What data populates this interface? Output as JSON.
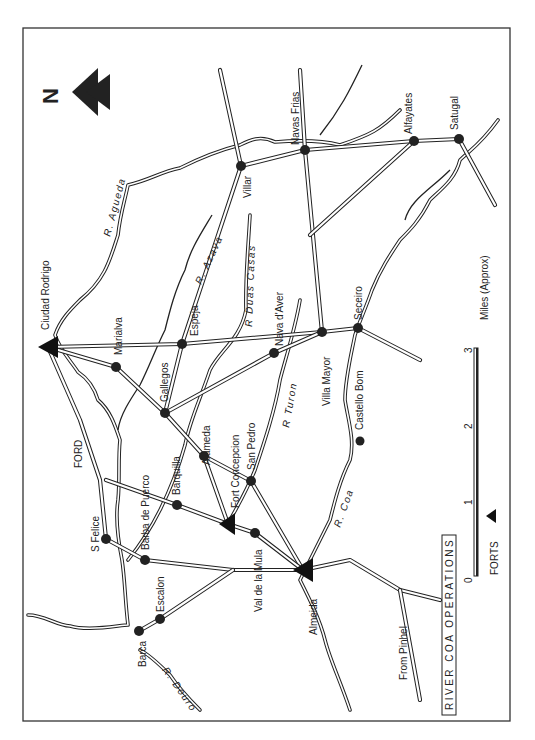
{
  "map": {
    "title": "RIVER COA OPERATIONS",
    "orientation": "rotated 90° (north points left)",
    "north_arrow": {
      "label": "N"
    },
    "towns": [
      {
        "name": "Villar",
        "x": 241,
        "y": 166
      },
      {
        "name": "Navas Frias",
        "x": 305,
        "y": 150
      },
      {
        "name": "Alfayates",
        "x": 414,
        "y": 141
      },
      {
        "name": "Satugal",
        "x": 459,
        "y": 139
      },
      {
        "name": "Espeja",
        "x": 182,
        "y": 344
      },
      {
        "name": "Marialva",
        "x": 116,
        "y": 367
      },
      {
        "name": "Gallegos",
        "x": 165,
        "y": 413
      },
      {
        "name": "Nava d'Aver",
        "x": 274,
        "y": 353
      },
      {
        "name": "Villa Mayor",
        "x": 322,
        "y": 332
      },
      {
        "name": "Seceiro",
        "x": 358,
        "y": 328
      },
      {
        "name": "Castello Bom",
        "x": 360,
        "y": 441
      },
      {
        "name": "Alameda",
        "x": 204,
        "y": 456
      },
      {
        "name": "San Pedro",
        "x": 251,
        "y": 481
      },
      {
        "name": "Barquilla",
        "x": 177,
        "y": 505
      },
      {
        "name": "Val de la Mula",
        "x": 255,
        "y": 533
      },
      {
        "name": "Barba de Puerco",
        "x": 145,
        "y": 560
      },
      {
        "name": "S Felice",
        "x": 106,
        "y": 539
      },
      {
        "name": "Escalon",
        "x": 160,
        "y": 619
      },
      {
        "name": "Barca",
        "x": 139,
        "y": 631
      }
    ],
    "forts": [
      {
        "name": "Ciudad Rodrigo",
        "x": 48,
        "y": 347
      },
      {
        "name": "Fort Concepcion",
        "x": 228,
        "y": 524
      },
      {
        "name": "Almeida",
        "x": 303,
        "y": 570
      }
    ],
    "rivers": [
      {
        "label": "R. Agueda"
      },
      {
        "label": "R. Azava"
      },
      {
        "label": "R  Duas Casas"
      },
      {
        "label": "R  Turon"
      },
      {
        "label": "R. Coa"
      },
      {
        "label": "R. Douro"
      }
    ],
    "annotations": {
      "ford": "FORD",
      "from_pinhel": "From Pinhel"
    }
  },
  "scale_bar": {
    "label": "Miles (Approx)",
    "ticks": [
      "0",
      "1",
      "2",
      "3"
    ]
  },
  "legend": {
    "forts_label": "FORTS"
  },
  "colors": {
    "ink": "#222222",
    "paper": "#ffffff"
  }
}
